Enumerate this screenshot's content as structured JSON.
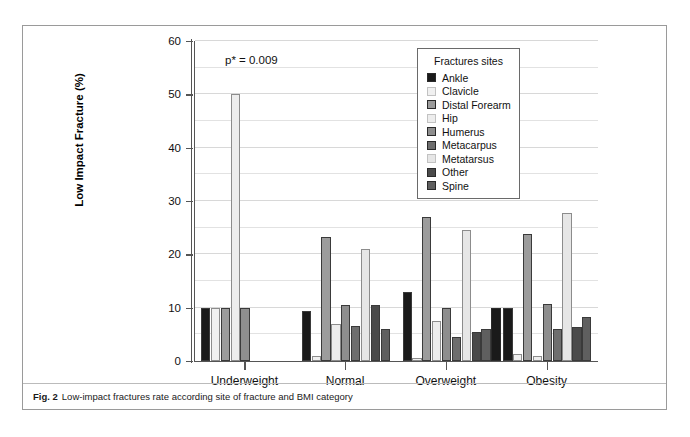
{
  "figure": {
    "caption_label": "Fig. 2",
    "caption_text": "Low-impact fractures rate according site of fracture and BMI category"
  },
  "annotation": {
    "p_value": "p* = 0.009"
  },
  "legend": {
    "title": "Fractures sites",
    "position": "inside-top-right"
  },
  "chart_data": {
    "type": "bar",
    "title": "",
    "subtitle": "",
    "xlabel": "",
    "ylabel": "Low Impact Fracture (%)",
    "ylim": [
      0,
      60
    ],
    "yticks": [
      0,
      10,
      20,
      30,
      40,
      50,
      60
    ],
    "ytick_labels": [
      "0",
      "10",
      "20",
      "30",
      "40",
      "50",
      "60"
    ],
    "grid": true,
    "grid_step": 5,
    "legend_title": "Fractures sites",
    "legend_position": "inside-top-right",
    "annotations": [
      "p* = 0.009"
    ],
    "categories": [
      "Underweight",
      "Normal",
      "Overweight",
      "Obesity"
    ],
    "series": [
      {
        "name": "Ankle",
        "color": "#1a1a1a",
        "values": [
          10.0,
          9.3,
          13.0,
          10.0
        ]
      },
      {
        "name": "Clavicle",
        "color": "#f0f0f0",
        "values": [
          10.0,
          1.0,
          0.5,
          1.3
        ]
      },
      {
        "name": "Distal Forearm",
        "color": "#9c9c9c",
        "values": [
          10.0,
          23.3,
          27.0,
          23.8
        ]
      },
      {
        "name": "Hip",
        "color": "#ededed",
        "values": [
          50.0,
          7.0,
          7.5,
          1.0
        ]
      },
      {
        "name": "Humerus",
        "color": "#8e8e8e",
        "values": [
          10.0,
          10.5,
          10.0,
          10.7
        ]
      },
      {
        "name": "Metacarpus",
        "color": "#6e6e6e",
        "values": [
          0.0,
          6.5,
          4.5,
          6.0
        ]
      },
      {
        "name": "Metatarsus",
        "color": "#e6e6e6",
        "values": [
          0.0,
          21.0,
          24.5,
          27.8
        ]
      },
      {
        "name": "Other",
        "color": "#4a4a4a",
        "values": [
          0.0,
          10.5,
          5.5,
          6.3
        ]
      },
      {
        "name": "Spine",
        "color": "#5f5f5f",
        "values": [
          0.0,
          6.0,
          6.0,
          8.3
        ]
      }
    ],
    "extra_black_bar": {
      "name": "Ankle-overweight-marker",
      "color": "#1a1a1a",
      "values": [
        0,
        0,
        10.0,
        0
      ]
    }
  }
}
